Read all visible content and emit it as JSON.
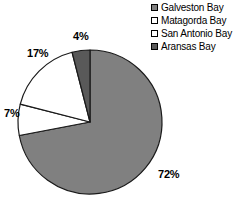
{
  "chart_data": {
    "type": "pie",
    "title": "",
    "categories": [
      "Galveston Bay",
      "Matagorda Bay",
      "San Antonio Bay",
      "Aransas Bay"
    ],
    "values": [
      72,
      7,
      17,
      4
    ],
    "value_labels": [
      "72%",
      "7%",
      "17%",
      "4%"
    ],
    "unit": "%",
    "colors": [
      "#808080",
      "#ffffff",
      "#ffffff",
      "#595959"
    ],
    "slice_border_color": "#1a1a1a",
    "legend_position": "top-right",
    "grid": false,
    "start_angle_deg": 0,
    "direction": "clockwise",
    "slices": [
      {
        "name": "Galveston Bay",
        "value": 72,
        "label": "72%",
        "color": "#808080"
      },
      {
        "name": "Matagorda Bay",
        "value": 7,
        "label": "7%",
        "color": "#ffffff"
      },
      {
        "name": "San Antonio Bay",
        "value": 17,
        "label": "17%",
        "color": "#ffffff"
      },
      {
        "name": "Aransas Bay",
        "value": 4,
        "label": "4%",
        "color": "#595959"
      }
    ]
  },
  "legend": {
    "items": [
      {
        "label": "Galveston Bay",
        "swatch": "#808080"
      },
      {
        "label": "Matagorda Bay",
        "swatch": "#ffffff"
      },
      {
        "label": "San Antonio Bay",
        "swatch": "#ffffff"
      },
      {
        "label": "Aransas Bay",
        "swatch": "#595959"
      }
    ]
  }
}
